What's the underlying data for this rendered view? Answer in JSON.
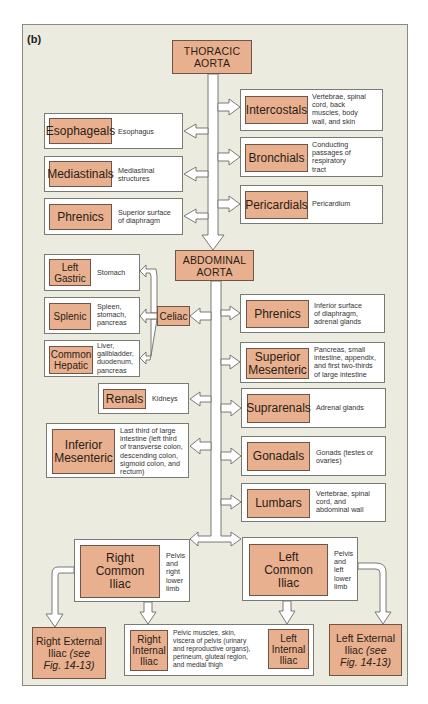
{
  "figure_label": "(b)",
  "thoracic_aorta": {
    "label_line1": "THORACIC",
    "label_line2": "AORTA"
  },
  "abdominal_aorta": {
    "label_line1": "ABDOMINAL",
    "label_line2": "AORTA"
  },
  "thoracic_left": [
    {
      "name": "Esophageals",
      "desc": [
        "Esophagus"
      ]
    },
    {
      "name": "Mediastinals",
      "desc": [
        "Mediastinal",
        "structures"
      ]
    },
    {
      "name": "Phrenics",
      "desc": [
        "Superior surface",
        "of diaphragm"
      ]
    }
  ],
  "thoracic_right": [
    {
      "name": "Intercostals",
      "desc": [
        "Vertebrae, spinal",
        "cord, back",
        "muscles, body",
        "wall, and skin"
      ]
    },
    {
      "name": "Bronchials",
      "desc": [
        "Conducting",
        "passages of",
        "respiratory",
        "tract"
      ]
    },
    {
      "name": "Pericardials",
      "desc": [
        "Pericardium"
      ]
    }
  ],
  "celiac": {
    "name": "Celiac"
  },
  "celiac_branches": [
    {
      "name_line1": "Left",
      "name_line2": "Gastric",
      "desc": [
        "Stomach"
      ]
    },
    {
      "name_line1": "Splenic",
      "name_line2": "",
      "desc": [
        "Spleen,",
        "stomach,",
        "pancreas"
      ]
    },
    {
      "name_line1": "Common",
      "name_line2": "Hepatic",
      "desc": [
        "Liver,",
        "gallbladder,",
        "duodenum,",
        "pancreas"
      ]
    }
  ],
  "abdominal_left": [
    {
      "name": "Renals",
      "desc": [
        "Kidneys"
      ]
    },
    {
      "name_line1": "Inferior",
      "name_line2": "Mesenteric",
      "desc": [
        "Last third of large",
        "intestine (left third",
        "of transverse colon,",
        "descending colon,",
        "sigmoid colon, and",
        "rectum)"
      ]
    }
  ],
  "abdominal_right": [
    {
      "name": "Phrenics",
      "desc": [
        "Inferior surface",
        "of diaphragm,",
        "adrenal glands"
      ]
    },
    {
      "name_line1": "Superior",
      "name_line2": "Mesenteric",
      "desc": [
        "Pancreas, small",
        "intestine, appendix,",
        "and first two-thirds",
        "of large intestine"
      ]
    },
    {
      "name": "Suprarenals",
      "desc": [
        "Adrenal glands"
      ]
    },
    {
      "name": "Gonadals",
      "desc": [
        "Gonads (testes or",
        "ovaries)"
      ]
    },
    {
      "name": "Lumbars",
      "desc": [
        "Vertebrae, spinal",
        "cord, and",
        "abdominal wall"
      ]
    }
  ],
  "common_iliacs": {
    "right": {
      "line1": "Right",
      "line2": "Common",
      "line3": "Iliac",
      "desc": [
        "Pelvis",
        "and",
        "right",
        "lower",
        "limb"
      ]
    },
    "left": {
      "line1": "Left",
      "line2": "Common",
      "line3": "Iliac",
      "desc": [
        "Pelvis",
        "and",
        "left",
        "lower",
        "limb"
      ]
    }
  },
  "external_iliacs": {
    "right": {
      "line1": "Right External",
      "line2": "Iliac",
      "see": "(see",
      "ref": "Fig. 14-13)"
    },
    "left": {
      "line1": "Left External",
      "line2": "Iliac",
      "see": "(see",
      "ref": "Fig. 14-13)"
    }
  },
  "internal_iliacs": {
    "right": {
      "line1": "Right",
      "line2": "Internal",
      "line3": "Iliac"
    },
    "left": {
      "line1": "Left",
      "line2": "Internal",
      "line3": "Iliac"
    },
    "desc": [
      "Pelvic muscles, skin,",
      "viscera of pelvis (urinary",
      "and reproductive organs),",
      "perineum, gluteal region,",
      "and medial thigh"
    ]
  },
  "colors": {
    "panel_bg": "#ecebdf",
    "artery_fill": "#e8b08f",
    "box_fill": "#ffffff",
    "border": "#7a7a74"
  }
}
